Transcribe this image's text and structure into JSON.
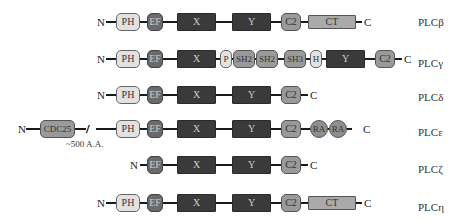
{
  "figure": {
    "type": "protein domain architecture of PLC isoforms",
    "terminus_labels": {
      "n": "N",
      "c": "C"
    },
    "rows": [
      {
        "name": "PLCβ",
        "domains": [
          "PH",
          "EF",
          "X",
          "Y",
          "C2",
          "CT"
        ]
      },
      {
        "name": "PLCγ",
        "domains": [
          "PH",
          "EF",
          "X",
          "P",
          "SH2",
          "SH2",
          "SH3",
          "H",
          "Y",
          "C2"
        ]
      },
      {
        "name": "PLCδ",
        "domains": [
          "PH",
          "EF",
          "X",
          "Y",
          "C2"
        ]
      },
      {
        "name": "PLCε",
        "domains": [
          "CDC25",
          "PH",
          "EF",
          "X",
          "Y",
          "C2",
          "RA",
          "RA"
        ],
        "annotation": "~500 A.A."
      },
      {
        "name": "PLCζ",
        "domains": [
          "EF",
          "X",
          "Y",
          "C2"
        ]
      },
      {
        "name": "PLCη",
        "domains": [
          "PH",
          "EF",
          "X",
          "Y",
          "C2",
          "CT"
        ]
      }
    ]
  },
  "labels": {
    "beta": "PLCβ",
    "gamma": "PLCγ",
    "delta": "PLCδ",
    "epsilon": "PLCε",
    "zeta": "PLCζ",
    "eta": "PLCη"
  },
  "domains": {
    "ph": "PH",
    "ef": "EF",
    "x": "X",
    "y": "Y",
    "c2": "C2",
    "ct": "CT",
    "p": "P",
    "sh2": "SH2",
    "sh3": "SH3",
    "h": "H",
    "cdc25": "CDC25",
    "ra": "RA"
  },
  "annotations": {
    "gap": "~500 A.A.",
    "break_mark": "//"
  },
  "colors": {
    "pale_domain": "#e2e2e2",
    "ef_domain": "#6a6a6a",
    "catalytic_xy": "#3a3a3a",
    "mid_domain": "#9a9a9a",
    "ct_domain": "#aaaaaa",
    "linker": "#1a1a1a"
  }
}
